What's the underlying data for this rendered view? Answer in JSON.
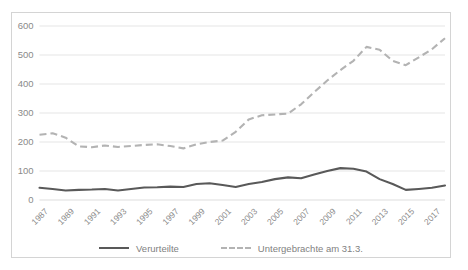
{
  "chart_data": {
    "type": "line",
    "title": "",
    "subtitle": "",
    "xlabel": "",
    "ylabel": "",
    "ylim": [
      0,
      600
    ],
    "yticks": [
      0,
      100,
      200,
      300,
      400,
      500,
      600
    ],
    "grid": true,
    "legend_position": "bottom",
    "x": [
      1987,
      1988,
      1989,
      1990,
      1991,
      1992,
      1993,
      1994,
      1995,
      1996,
      1997,
      1998,
      1999,
      2000,
      2001,
      2002,
      2003,
      2004,
      2005,
      2006,
      2007,
      2008,
      2009,
      2010,
      2011,
      2012,
      2013,
      2014,
      2015,
      2016,
      2017,
      2018
    ],
    "xtick_labels": [
      "1987",
      "1989",
      "1991",
      "1993",
      "1995",
      "1997",
      "1999",
      "2001",
      "2003",
      "2005",
      "2007",
      "2009",
      "2011",
      "2013",
      "2015",
      "2017"
    ],
    "series": [
      {
        "name": "Verurteilte",
        "style": "solid",
        "color": "#595959",
        "values": [
          42,
          38,
          33,
          35,
          36,
          38,
          33,
          38,
          43,
          44,
          46,
          45,
          55,
          58,
          52,
          45,
          55,
          62,
          72,
          78,
          75,
          88,
          100,
          110,
          108,
          98,
          72,
          55,
          35,
          38,
          42,
          50
        ]
      },
      {
        "name": "Untergebrachte am 31.3.",
        "style": "dashed",
        "color": "#b3b3b3",
        "values": [
          225,
          230,
          215,
          185,
          182,
          188,
          183,
          186,
          190,
          192,
          186,
          178,
          192,
          200,
          205,
          235,
          278,
          292,
          295,
          298,
          330,
          372,
          412,
          448,
          480,
          528,
          518,
          480,
          465,
          492,
          520,
          558
        ]
      }
    ]
  },
  "legend": {
    "items": [
      {
        "label": "Verurteilte",
        "style": "solid",
        "color": "#595959"
      },
      {
        "label": "Untergebrachte am 31.3.",
        "style": "dashed",
        "color": "#b3b3b3"
      }
    ]
  },
  "colors": {
    "background": "#ffffff",
    "frame_border": "#d4d4d4",
    "gridline": "#e2e2e2",
    "tick_text": "#8a8a8a",
    "legend_text": "#7f7f7f"
  }
}
